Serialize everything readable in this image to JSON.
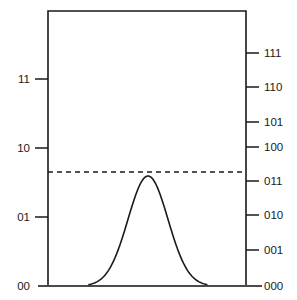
{
  "figure": {
    "background_color": "#ffffff",
    "line_color": "#1a1a1a",
    "curve_color": "#1a1a1a",
    "dashed_line_color": "#1a1a1a"
  },
  "chart_data": {
    "type": "line",
    "title": "",
    "xlabel": "",
    "ylabel": "",
    "grid": false,
    "legend": null,
    "plot_frame": {
      "left": 48,
      "right": 246,
      "top": 11,
      "bottom": 286
    },
    "left_axis": {
      "name": "2-bit quantization scale",
      "bits": 2,
      "tick_labels": [
        "11",
        "10",
        "01",
        "00"
      ],
      "tick_values": [
        3,
        2,
        1,
        0
      ],
      "tick_y": [
        79,
        148,
        217,
        286
      ],
      "range": [
        0,
        3
      ]
    },
    "right_axis": {
      "name": "3-bit quantization scale",
      "bits": 3,
      "tick_labels": [
        "111",
        "110",
        "101",
        "100",
        "011",
        "010",
        "001",
        "000"
      ],
      "tick_values": [
        7,
        6,
        5,
        4,
        3,
        2,
        1,
        0
      ],
      "tick_y": [
        53,
        87,
        122,
        147,
        181,
        215,
        250,
        286
      ],
      "range": [
        0,
        7
      ]
    },
    "threshold_line": {
      "label": "",
      "style": "dashed",
      "y": 172,
      "left_value": "between 01 and 10",
      "right_value": "just above 011",
      "dash_pattern": "5,4"
    },
    "series": [
      {
        "name": "Gaussian signal distribution",
        "type": "gaussian",
        "center_x": 148,
        "peak_y": 176,
        "baseline_y": 286,
        "sigma_px": 20,
        "left_tail_x": 99,
        "right_tail_x": 197,
        "x": [
          99,
          105,
          111,
          117,
          123,
          129,
          135,
          141,
          148,
          155,
          161,
          167,
          173,
          179,
          185,
          191,
          197
        ],
        "y": [
          286,
          285,
          282,
          276,
          264,
          245,
          219,
          192,
          176,
          192,
          219,
          245,
          264,
          276,
          282,
          285,
          286
        ]
      }
    ]
  }
}
